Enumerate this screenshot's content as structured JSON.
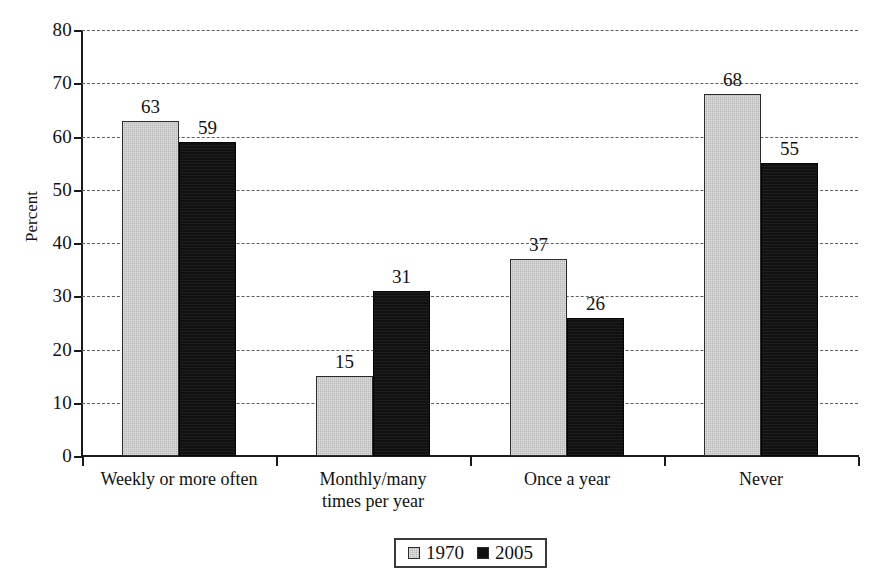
{
  "chart_data": {
    "type": "bar",
    "title": "",
    "subtitle": "",
    "xlabel": "",
    "ylabel": "Percent",
    "ylim": [
      0,
      80
    ],
    "ytick_step": 10,
    "yticks": [
      0,
      10,
      20,
      30,
      40,
      50,
      60,
      70,
      80
    ],
    "grid": true,
    "grid_axis": "y",
    "grid_style": "dashed",
    "legend_position": "bottom-center",
    "categories": [
      "Weekly or more often",
      "Monthly/many times per year",
      "Once a year",
      "Never"
    ],
    "category_lines": [
      [
        "Weekly or more often"
      ],
      [
        "Monthly/many",
        "times per year"
      ],
      [
        "Once a year"
      ],
      [
        "Never"
      ]
    ],
    "series": [
      {
        "name": "1970",
        "color": "#b9b9b9",
        "values": [
          63,
          15,
          37,
          68
        ]
      },
      {
        "name": "2005",
        "color": "#111111",
        "values": [
          59,
          31,
          26,
          55
        ]
      }
    ],
    "data_labels": [
      [
        "63",
        "15",
        "37",
        "68"
      ],
      [
        "59",
        "31",
        "26",
        "55"
      ]
    ]
  },
  "legend": {
    "items": [
      {
        "label": "1970",
        "swatch": "gray-square-swatch"
      },
      {
        "label": "2005",
        "swatch": "black-square-swatch"
      }
    ]
  },
  "axes": {
    "y_title": "Percent",
    "y_tick_labels": [
      "80",
      "70",
      "60",
      "50",
      "40",
      "30",
      "20",
      "10",
      "0"
    ]
  },
  "colors": {
    "series_1970": "#b9b9b9",
    "series_2005": "#111111",
    "axis": "#1a1a1a",
    "gridline": "#5e5e5e",
    "background": "#ffffff"
  }
}
